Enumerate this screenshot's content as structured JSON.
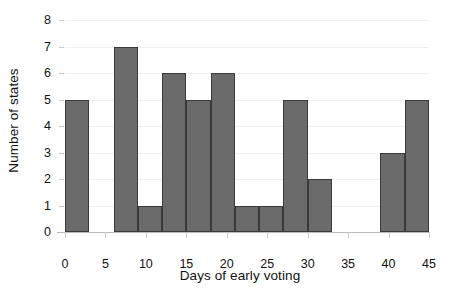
{
  "chart_data": {
    "type": "bar",
    "title": "",
    "subtitle": "",
    "xlabel": "Days of early voting",
    "ylabel": "Number of states",
    "xlim": [
      0,
      45
    ],
    "ylim": [
      0,
      8
    ],
    "grid": true,
    "legend": null,
    "bin_width": 3,
    "x_ticks": [
      0,
      5,
      10,
      15,
      20,
      25,
      30,
      35,
      40,
      45
    ],
    "x_tick_labels": [
      "0",
      "5",
      "10",
      "15",
      "20",
      "25",
      "30",
      "35",
      "40",
      "45"
    ],
    "y_ticks": [
      0,
      1,
      2,
      3,
      4,
      5,
      6,
      7,
      8
    ],
    "y_tick_labels": [
      "0",
      "1",
      "2",
      "3",
      "4",
      "5",
      "6",
      "7",
      "8"
    ],
    "bin_edges": [
      0,
      3,
      6,
      9,
      12,
      15,
      18,
      21,
      24,
      27,
      30,
      33,
      36,
      39,
      42,
      45
    ],
    "categories": [
      "0-3",
      "3-6",
      "6-9",
      "9-12",
      "12-15",
      "15-18",
      "18-21",
      "21-24",
      "24-27",
      "27-30",
      "30-33",
      "33-36",
      "36-39",
      "39-42",
      "42-45"
    ],
    "values": [
      5,
      0,
      7,
      1,
      6,
      5,
      6,
      1,
      1,
      5,
      2,
      0,
      0,
      3,
      5
    ],
    "bars": [
      {
        "label": "0-3",
        "start": 0,
        "end": 3,
        "value": 5
      },
      {
        "label": "6-9",
        "start": 6,
        "end": 9,
        "value": 7
      },
      {
        "label": "9-12",
        "start": 9,
        "end": 12,
        "value": 1
      },
      {
        "label": "12-15",
        "start": 12,
        "end": 15,
        "value": 6
      },
      {
        "label": "15-18",
        "start": 15,
        "end": 18,
        "value": 5
      },
      {
        "label": "18-21",
        "start": 18,
        "end": 21,
        "value": 6
      },
      {
        "label": "21-24",
        "start": 21,
        "end": 24,
        "value": 1
      },
      {
        "label": "24-27",
        "start": 24,
        "end": 27,
        "value": 1
      },
      {
        "label": "27-30",
        "start": 27,
        "end": 30,
        "value": 5
      },
      {
        "label": "30-33",
        "start": 30,
        "end": 33,
        "value": 2
      },
      {
        "label": "39-42",
        "start": 39,
        "end": 42,
        "value": 3
      },
      {
        "label": "42-45",
        "start": 42,
        "end": 45,
        "value": 5
      }
    ],
    "colors": {
      "bar_fill": "#6b6b6b",
      "bar_edge": "#3a3a3a",
      "gridline": "#f0f0f0",
      "axis": "#b9b9b9",
      "text": "#111111",
      "background": "#ffffff"
    }
  }
}
